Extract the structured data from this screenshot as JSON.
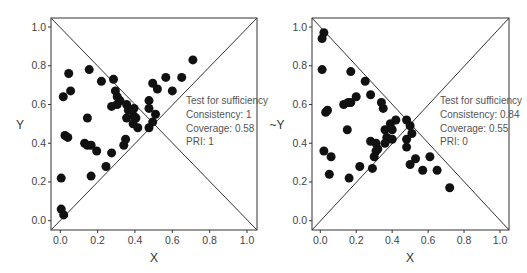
{
  "chart_data": [
    {
      "type": "scatter",
      "title": "",
      "xlabel": "X",
      "ylabel": "Y",
      "xlim": [
        -0.05,
        1.05
      ],
      "ylim": [
        -0.05,
        1.05
      ],
      "xticks": [
        "0.0",
        "0.2",
        "0.4",
        "0.6",
        "0.8",
        "1.0"
      ],
      "yticks": [
        "0.0",
        "0.2",
        "0.4",
        "0.6",
        "0.8",
        "1.0"
      ],
      "grid": false,
      "reference_lines": [
        "diagonal y=x",
        "anti-diagonal y=1-x"
      ],
      "annotation": [
        "Test for sufficiency",
        "Consistency: 1",
        "Coverage: 0.58",
        "PRI: 1"
      ],
      "points": [
        [
          0.71,
          0.83
        ],
        [
          0.045,
          0.76
        ],
        [
          0.155,
          0.78
        ],
        [
          0.285,
          0.73
        ],
        [
          0.22,
          0.72
        ],
        [
          0.016,
          0.64
        ],
        [
          0.055,
          0.67
        ],
        [
          0.565,
          0.74
        ],
        [
          0.65,
          0.74
        ],
        [
          0.495,
          0.71
        ],
        [
          0.52,
          0.68
        ],
        [
          0.6,
          0.67
        ],
        [
          0.295,
          0.67
        ],
        [
          0.305,
          0.64
        ],
        [
          0.32,
          0.62
        ],
        [
          0.305,
          0.6
        ],
        [
          0.275,
          0.59
        ],
        [
          0.355,
          0.6
        ],
        [
          0.395,
          0.58
        ],
        [
          0.475,
          0.62
        ],
        [
          0.475,
          0.58
        ],
        [
          0.365,
          0.57
        ],
        [
          0.355,
          0.53
        ],
        [
          0.145,
          0.53
        ],
        [
          0.395,
          0.54
        ],
        [
          0.405,
          0.53
        ],
        [
          0.39,
          0.5
        ],
        [
          0.415,
          0.48
        ],
        [
          0.51,
          0.55
        ],
        [
          0.495,
          0.51
        ],
        [
          0.475,
          0.48
        ],
        [
          0.025,
          0.44
        ],
        [
          0.04,
          0.43
        ],
        [
          0.13,
          0.4
        ],
        [
          0.145,
          0.39
        ],
        [
          0.165,
          0.39
        ],
        [
          0.35,
          0.42
        ],
        [
          0.34,
          0.39
        ],
        [
          0.195,
          0.36
        ],
        [
          0.275,
          0.35
        ],
        [
          0.245,
          0.28
        ],
        [
          0.165,
          0.23
        ],
        [
          0.005,
          0.22
        ],
        [
          0.005,
          0.06
        ],
        [
          0.018,
          0.03
        ]
      ]
    },
    {
      "type": "scatter",
      "title": "",
      "xlabel": "X",
      "ylabel": "~Y",
      "xlim": [
        -0.05,
        1.05
      ],
      "ylim": [
        -0.05,
        1.05
      ],
      "xticks": [
        "0.0",
        "0.2",
        "0.4",
        "0.6",
        "0.8",
        "1.0"
      ],
      "yticks": [
        "0.0",
        "0.2",
        "0.4",
        "0.6",
        "0.8",
        "1.0"
      ],
      "grid": false,
      "reference_lines": [
        "diagonal y=x",
        "anti-diagonal y=1-x"
      ],
      "annotation": [
        "Test for sufficiency",
        "Consistency: 0.84",
        "Coverage: 0.55",
        "PRI: 0"
      ],
      "points": [
        [
          0.02,
          0.97
        ],
        [
          0.01,
          0.94
        ],
        [
          0.01,
          0.78
        ],
        [
          0.17,
          0.77
        ],
        [
          0.25,
          0.72
        ],
        [
          0.28,
          0.65
        ],
        [
          0.2,
          0.64
        ],
        [
          0.13,
          0.6
        ],
        [
          0.155,
          0.61
        ],
        [
          0.17,
          0.61
        ],
        [
          0.34,
          0.61
        ],
        [
          0.35,
          0.58
        ],
        [
          0.03,
          0.56
        ],
        [
          0.04,
          0.57
        ],
        [
          0.15,
          0.47
        ],
        [
          0.42,
          0.52
        ],
        [
          0.48,
          0.52
        ],
        [
          0.5,
          0.49
        ],
        [
          0.39,
          0.5
        ],
        [
          0.36,
          0.47
        ],
        [
          0.4,
          0.47
        ],
        [
          0.51,
          0.45
        ],
        [
          0.37,
          0.43
        ],
        [
          0.4,
          0.42
        ],
        [
          0.48,
          0.42
        ],
        [
          0.36,
          0.4
        ],
        [
          0.28,
          0.41
        ],
        [
          0.31,
          0.4
        ],
        [
          0.32,
          0.37
        ],
        [
          0.31,
          0.36
        ],
        [
          0.48,
          0.38
        ],
        [
          0.02,
          0.36
        ],
        [
          0.06,
          0.33
        ],
        [
          0.3,
          0.33
        ],
        [
          0.53,
          0.32
        ],
        [
          0.61,
          0.33
        ],
        [
          0.5,
          0.29
        ],
        [
          0.22,
          0.28
        ],
        [
          0.29,
          0.27
        ],
        [
          0.57,
          0.26
        ],
        [
          0.65,
          0.26
        ],
        [
          0.05,
          0.24
        ],
        [
          0.16,
          0.22
        ],
        [
          0.72,
          0.17
        ]
      ]
    }
  ],
  "panels": [
    {
      "xlabel": "X",
      "ylabel": "Y",
      "ann": [
        "Test for sufficiency",
        "Consistency: 1",
        "Coverage: 0.58",
        "PRI: 1"
      ]
    },
    {
      "xlabel": "X",
      "ylabel": "~Y",
      "ann": [
        "Test for sufficiency",
        "Consistency: 0.84",
        "Coverage: 0.55",
        "PRI: 0"
      ]
    }
  ],
  "colors": {
    "points": "#111111",
    "frame": "#333333",
    "text": "#444444"
  }
}
